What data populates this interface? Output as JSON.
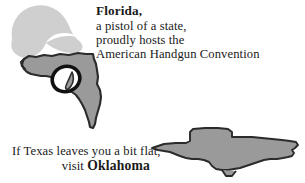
{
  "image": {
    "kind": "cartoon-illustration",
    "width": 305,
    "height": 183,
    "background_color": "#ffffff"
  },
  "palette": {
    "background": "#ffffff",
    "smoke_gray": "#cfcfcf",
    "state_fill_gray": "#9a9a9a",
    "state_outline": "#2b2b2b",
    "trigger_guard": "#111111",
    "text_color": "#1a1a1a"
  },
  "florida_panel": {
    "caption": {
      "lines": [
        "Florida,",
        "a pistol of a state,",
        "proudly hosts the",
        "American Handgun Convention"
      ],
      "headword": "Florida,",
      "line2": "a pistol of a state,",
      "line3": "proudly hosts the",
      "line4": "American Handgun Convention"
    },
    "artwork": {
      "smoke_puff_label": "smoke-puff",
      "state_label": "florida-state-shape",
      "gun_parts": [
        "barrel-panhandle",
        "trigger-guard",
        "trigger",
        "grip-peninsula"
      ]
    }
  },
  "texas_panel": {
    "caption": {
      "lines": [
        "If Texas leaves you a bit flat,",
        "visit Oklahoma"
      ],
      "line1": "If Texas leaves you a bit flat,",
      "line2_prefix": "visit ",
      "line2_emphasis": "Oklahoma"
    },
    "artwork": {
      "state_label": "texas-state-shape-flattened"
    }
  }
}
